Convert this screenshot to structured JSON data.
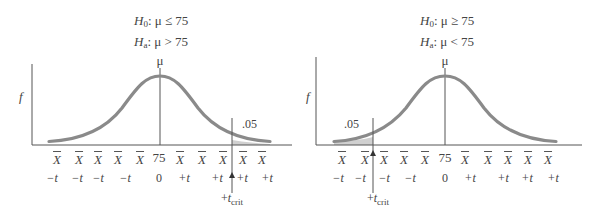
{
  "colors": {
    "curve": "#8a8a8a",
    "axis": "#555555",
    "shade": "#d0d0d0",
    "text": "#444444"
  },
  "left_panel": {
    "hypotheses": {
      "h0_symbol": "H",
      "h0_sub": "0",
      "h0_rest": ": μ ≤ 75",
      "ha_symbol": "H",
      "ha_sub": "a",
      "ha_rest": ": μ > 75"
    },
    "y_axis_label": "f",
    "mean_label": "μ",
    "alpha_label": ".05",
    "tail": "right",
    "x_labels": [
      "X",
      "X",
      "X",
      "X",
      "X",
      "75",
      "X",
      "X",
      "X",
      "X",
      "X"
    ],
    "t_labels": [
      "−t",
      "−t",
      "−t",
      "−t",
      "0",
      "+t",
      "+t",
      "+t",
      "+t"
    ],
    "tcrit_label": {
      "prefix": "+",
      "var": "t",
      "sub": "crit"
    }
  },
  "right_panel": {
    "hypotheses": {
      "h0_symbol": "H",
      "h0_sub": "0",
      "h0_rest": ": μ ≥ 75",
      "ha_symbol": "H",
      "ha_sub": "a",
      "ha_rest": ": μ < 75"
    },
    "y_axis_label": "f",
    "mean_label": "μ",
    "alpha_label": ".05",
    "tail": "left",
    "x_labels": [
      "X",
      "X",
      "X",
      "X",
      "X",
      "75",
      "X",
      "X",
      "X",
      "X",
      "X"
    ],
    "t_labels": [
      "−t",
      "−t",
      "−t",
      "−t",
      "0",
      "+t",
      "+t",
      "+t",
      "+t"
    ],
    "tcrit_label": {
      "prefix": "+",
      "var": "t",
      "sub": "crit"
    }
  }
}
